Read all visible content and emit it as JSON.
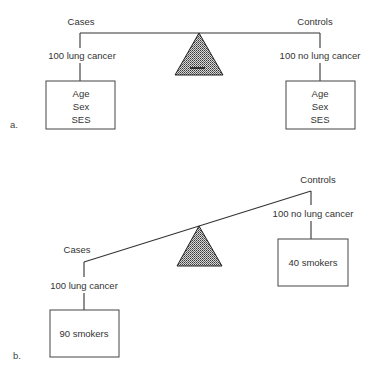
{
  "figure": {
    "panel_a": {
      "label": "a.",
      "left": {
        "group": "Cases",
        "count_label": "100 lung cancer",
        "box_lines": [
          "Age",
          "Sex",
          "SES"
        ]
      },
      "right": {
        "group": "Controls",
        "count_label": "100 no lung cancer",
        "box_lines": [
          "Age",
          "Sex",
          "SES"
        ]
      },
      "balance_state": "level"
    },
    "panel_b": {
      "label": "b.",
      "left": {
        "group": "Cases",
        "count_label": "100 lung cancer",
        "box_lines": [
          "90 smokers"
        ]
      },
      "right": {
        "group": "Controls",
        "count_label": "100 no lung cancer",
        "box_lines": [
          "40 smokers"
        ]
      },
      "balance_state": "tilted"
    },
    "colors": {
      "line": "#333333",
      "fulcrum_fill": "#8a8a8a",
      "background": "#ffffff"
    }
  }
}
